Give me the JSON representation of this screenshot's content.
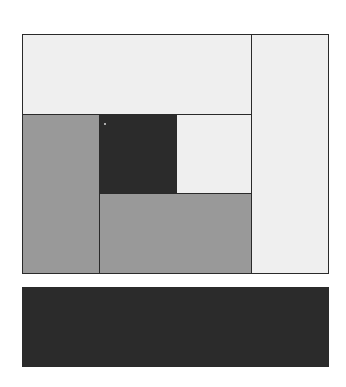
{
  "diagram": {
    "type": "rectangle-partition",
    "colors": {
      "light": "#efefef",
      "gray": "#999999",
      "dark": "#2b2b2b",
      "border": "#2a2a2a",
      "dot": "#d8d8d8"
    },
    "blocks": [
      {
        "id": "top-wide",
        "x": 22,
        "y": 34,
        "w": 230,
        "h": 81,
        "fill": "#efefef"
      },
      {
        "id": "right-tall",
        "x": 251,
        "y": 34,
        "w": 78,
        "h": 240,
        "fill": "#efefef"
      },
      {
        "id": "left-gray",
        "x": 22,
        "y": 114,
        "w": 78,
        "h": 160,
        "fill": "#999999"
      },
      {
        "id": "center-dark",
        "x": 99,
        "y": 114,
        "w": 78,
        "h": 80,
        "fill": "#2b2b2b"
      },
      {
        "id": "center-right-light",
        "x": 176,
        "y": 114,
        "w": 76,
        "h": 80,
        "fill": "#efefef"
      },
      {
        "id": "bottom-gray",
        "x": 99,
        "y": 193,
        "w": 153,
        "h": 81,
        "fill": "#999999"
      },
      {
        "id": "bottom-bar-dark",
        "x": 22,
        "y": 287,
        "w": 307,
        "h": 80,
        "fill": "#2b2b2b"
      }
    ],
    "dot": {
      "x": 104,
      "y": 123
    }
  }
}
